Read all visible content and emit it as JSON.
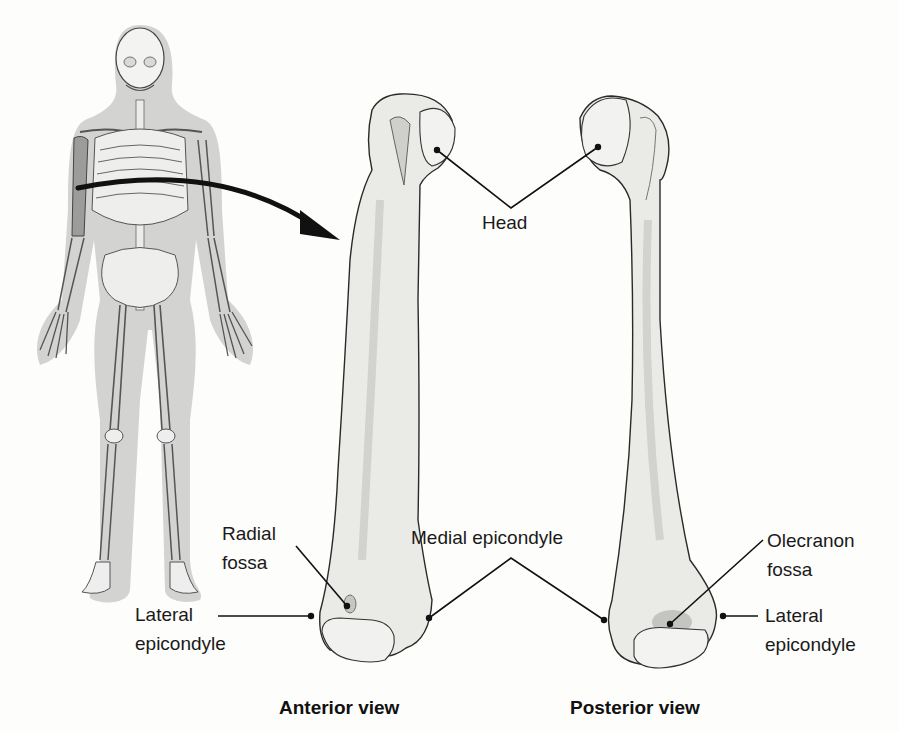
{
  "figure": {
    "views": [
      {
        "id": "anterior",
        "caption": "Anterior view"
      },
      {
        "id": "posterior",
        "caption": "Posterior view"
      }
    ],
    "labels": {
      "head": "Head",
      "radial_fossa_line1": "Radial",
      "radial_fossa_line2": "fossa",
      "medial_epicondyle": "Medial epicondyle",
      "olecranon_fossa_line1": "Olecranon",
      "olecranon_fossa_line2": "fossa",
      "lateral_epicondyle_left_line1": "Lateral",
      "lateral_epicondyle_left_line2": "epicondyle",
      "lateral_epicondyle_right_line1": "Lateral",
      "lateral_epicondyle_right_line2": "epicondyle"
    },
    "colors": {
      "bone_fill": "#e9e9e6",
      "bone_shadow": "#c9c9c5",
      "outline": "#2a2a2a",
      "skeleton_halo": "#cfcfcf",
      "highlight_bone": "#9a9a9a",
      "arrow": "#111111"
    }
  }
}
